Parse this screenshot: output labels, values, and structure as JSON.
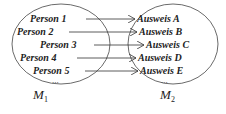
{
  "diagram": {
    "type": "set-mapping",
    "left_set": {
      "name": "M",
      "subscript": "1",
      "elements": [
        "Person 1",
        "Person 2",
        "Person 3",
        "Person 4",
        "Person 5"
      ],
      "ellipsis": "..."
    },
    "right_set": {
      "name": "M",
      "subscript": "2",
      "elements": [
        "Ausweis A",
        "Ausweis B",
        "Ausweis C",
        "Ausweis D",
        "Ausweis E"
      ],
      "ellipsis": "..."
    },
    "mappings": [
      {
        "from": "Person 1",
        "to": "Ausweis A"
      },
      {
        "from": "Person 2",
        "to": "Ausweis B"
      },
      {
        "from": "Person 3",
        "to": "Ausweis C"
      },
      {
        "from": "Person 4",
        "to": "Ausweis D"
      },
      {
        "from": "Person 5",
        "to": "Ausweis E"
      }
    ],
    "colors": {
      "stroke": "#333333",
      "text": "#222222",
      "background": "#ffffff"
    }
  }
}
